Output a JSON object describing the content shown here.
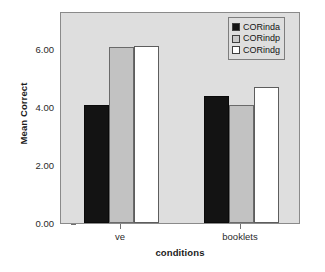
{
  "chart_data": {
    "type": "bar",
    "title": "",
    "xlabel": "conditions",
    "ylabel": "Mean Correct",
    "categories": [
      "ve",
      "booklets"
    ],
    "series": [
      {
        "name": "CORinda",
        "color": "#131313",
        "values": [
          4.08,
          4.38
        ]
      },
      {
        "name": "CORindp",
        "color": "#c2c2c2",
        "values": [
          6.05,
          4.08
        ]
      },
      {
        "name": "CORindg",
        "color": "#ffffff",
        "values": [
          6.1,
          4.68
        ]
      }
    ],
    "ylim": [
      0,
      7.3
    ],
    "yticks": [
      0,
      2,
      4,
      6
    ],
    "ytick_labels": [
      "0.00",
      "2.00",
      "4.00",
      "6.00"
    ],
    "grid": false,
    "legend_position": "top-right",
    "plot_background": "#dedede"
  }
}
